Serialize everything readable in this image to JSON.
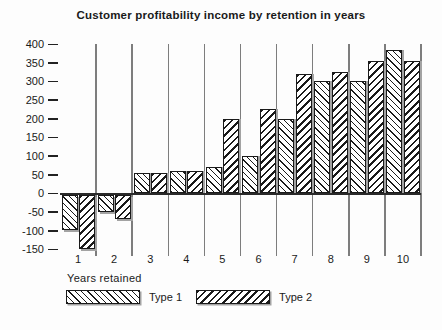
{
  "title": "Customer profitability income by retention in years",
  "chart_data": {
    "type": "bar",
    "title": "Customer profitability income by retention in years",
    "categories": [
      "1",
      "2",
      "3",
      "4",
      "5",
      "6",
      "7",
      "8",
      "9",
      "10"
    ],
    "series": [
      {
        "name": "Type 1",
        "hatch": "thin-backslash-lines",
        "values": [
          -100,
          -50,
          55,
          60,
          70,
          100,
          200,
          300,
          300,
          385
        ]
      },
      {
        "name": "Type 2",
        "hatch": "thick-forwardslash-lines",
        "values": [
          -150,
          -70,
          55,
          60,
          200,
          225,
          320,
          325,
          355,
          355
        ]
      }
    ],
    "xlabel": "Years retained",
    "ylabel": "",
    "ylim": [
      -150,
      400
    ],
    "y_ticks": [
      400,
      350,
      300,
      250,
      200,
      150,
      100,
      50,
      0,
      -50,
      -100,
      -150
    ],
    "grid": "vertical-category-separators",
    "legend_position": "bottom-left"
  },
  "colors": {
    "background": "#fdfdfd",
    "text": "#1a1a1a",
    "bar_fill": "#ffffff",
    "bar_hatch": "#1a1a1a",
    "gridline": "#7d7d7d",
    "zero_line": "#2a2a2a",
    "shadow": "#a3a3a3"
  }
}
